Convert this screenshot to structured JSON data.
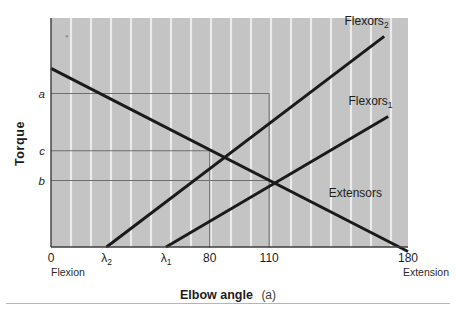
{
  "figure": {
    "background_color": "#ffffff",
    "plot_background_color": "#c4c4c4",
    "gridline_color": "#f2f2f2",
    "line_color": "#1a1a1a",
    "reference_line_color": "#6e6e6e",
    "axis_color": "#3d3d3d"
  },
  "chart_data": {
    "type": "line",
    "title": "",
    "xlabel": "Elbow angle",
    "xlabel_paren": "(a)",
    "ylabel": "Torque",
    "xlim": [
      0,
      180
    ],
    "ylim": [
      0,
      100
    ],
    "grid": "vertical-white-stripes",
    "legend_position": "inline-right-of-line-ends",
    "xticks": [
      {
        "value": 0,
        "label": "0",
        "sub": ""
      },
      {
        "value": 28,
        "label": "λ",
        "sub": "2"
      },
      {
        "value": 58,
        "label": "λ",
        "sub": "1"
      },
      {
        "value": 80,
        "label": "80",
        "sub": ""
      },
      {
        "value": 110,
        "label": "110",
        "sub": ""
      },
      {
        "value": 180,
        "label": "180",
        "sub": ""
      }
    ],
    "x_end_labels": {
      "left": "Flexion",
      "right": "Extension"
    },
    "yticks": [
      {
        "value": 67,
        "label": "a"
      },
      {
        "value": 42,
        "label": "c"
      },
      {
        "value": 29,
        "label": "b"
      }
    ],
    "series": [
      {
        "name": "Extensors",
        "label": "Extensors",
        "sub": "",
        "x": [
          0,
          180
        ],
        "y": [
          78,
          -2
        ],
        "label_x": 140,
        "label_y": 22
      },
      {
        "name": "Flexors1",
        "label": "Flexors",
        "sub": "1",
        "x": [
          58,
          170
        ],
        "y": [
          0,
          57
        ],
        "label_x": 150,
        "label_y": 62
      },
      {
        "name": "Flexors2",
        "label": "Flexors",
        "sub": "2",
        "x": [
          28,
          168
        ],
        "y": [
          0,
          92
        ],
        "label_x": 148,
        "label_y": 97
      }
    ],
    "reference_lines": [
      {
        "name": "level-a",
        "type": "horizontal",
        "y": 67,
        "x_from": 0,
        "x_to": 110
      },
      {
        "name": "level-c",
        "type": "horizontal",
        "y": 42,
        "x_from": 0,
        "x_to": 80
      },
      {
        "name": "level-b",
        "type": "horizontal",
        "y": 29,
        "x_from": 0,
        "x_to": 110
      },
      {
        "name": "dropline-80",
        "type": "vertical",
        "x": 80,
        "y_from": 0,
        "y_to": 42
      },
      {
        "name": "dropline-110",
        "type": "vertical",
        "x": 110,
        "y_from": 0,
        "y_to": 67
      }
    ],
    "intersections": [
      {
        "name": "flexors2-x-extensors",
        "x": 80,
        "y": 42
      },
      {
        "name": "flexors1-x-extensors",
        "x": 110,
        "y": 29
      }
    ],
    "annotations": [
      {
        "name": "scan-speck",
        "x": 8,
        "y": 92
      }
    ]
  }
}
